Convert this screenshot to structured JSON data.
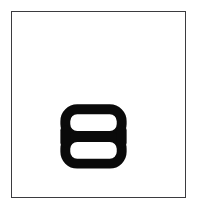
{
  "canvas": {
    "width_px": 198,
    "height_px": 216,
    "background_color": "#ffffff",
    "margin_color": "#ffffff"
  },
  "frame": {
    "name": "image-border-frame",
    "border_color": "#3b3b3f",
    "border_width_px": 1,
    "fill_color": "#ffffff",
    "left_px": 11,
    "top_px": 11,
    "width_px": 175,
    "height_px": 187
  },
  "glyph": {
    "character": "8",
    "semantic_name": "numeral-eight",
    "description": "Bold black numeral eight formed by two stacked rounded-rectangle lobes joined at a pinched waist",
    "color": "#0a0a0a",
    "stroke_width_px": 10,
    "bounds": {
      "left_px": 61,
      "top_px": 104,
      "width_px": 69,
      "height_px": 65
    },
    "upper_lobe": {
      "name": "upper-counter",
      "fill_color": "#ffffff",
      "corner_radius_px": 12
    },
    "lower_lobe": {
      "name": "lower-counter",
      "fill_color": "#ffffff",
      "corner_radius_px": 12
    }
  }
}
